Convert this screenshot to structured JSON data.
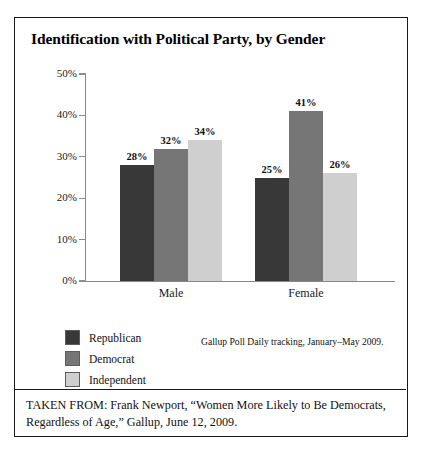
{
  "chart_data": {
    "type": "bar",
    "title": "Identification with Political Party, by Gender",
    "categories": [
      "Male",
      "Female"
    ],
    "series": [
      {
        "name": "Republican",
        "values": [
          28,
          25
        ],
        "color": "#383838"
      },
      {
        "name": "Democrat",
        "values": [
          32,
          41
        ],
        "color": "#767676"
      },
      {
        "name": "Independent",
        "values": [
          34,
          26
        ],
        "color": "#cfcfcf"
      }
    ],
    "value_labels": [
      [
        "28%",
        "32%",
        "34%"
      ],
      [
        "25%",
        "41%",
        "26%"
      ]
    ],
    "xlabel": "",
    "ylabel": "",
    "ylim": [
      0,
      50
    ],
    "yticks": [
      0,
      10,
      20,
      30,
      40,
      50
    ],
    "ytick_labels": [
      "0%",
      "10%",
      "20%",
      "30%",
      "40%",
      "50%"
    ],
    "grid": false,
    "legend_position": "bottom-left",
    "annotation": "Gallup Poll Daily tracking, January–May 2009."
  },
  "source_note": "Gallup Poll Daily tracking, January–May 2009.",
  "footer": {
    "text": "TAKEN FROM: Frank Newport, “Women More Likely to Be Democrats, Regardless of Age,” Gallup, June 12, 2009."
  },
  "colors": {
    "republican": "#383838",
    "democrat": "#767676",
    "independent": "#cfcfcf",
    "axis": "#888888",
    "border": "#1a1a1a"
  }
}
